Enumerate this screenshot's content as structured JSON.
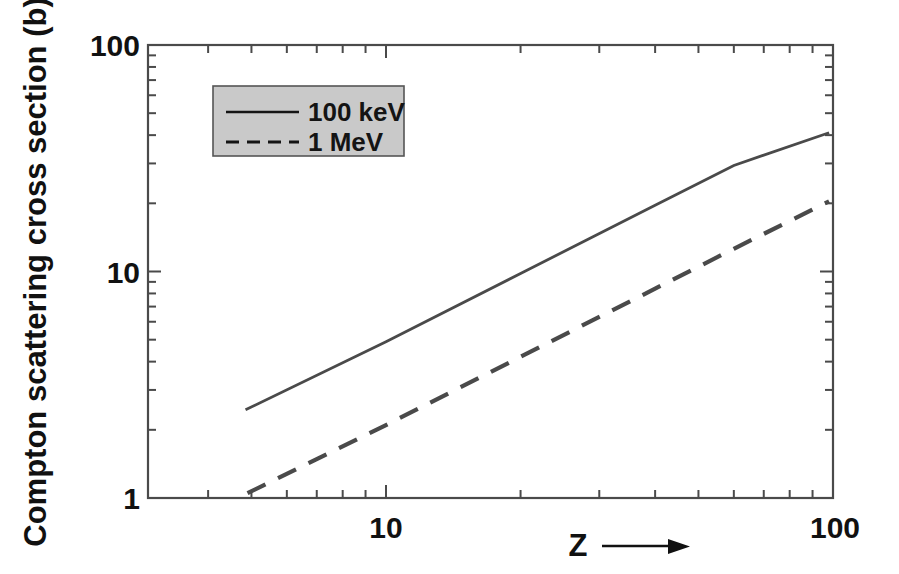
{
  "chart_data": {
    "type": "line",
    "title": "",
    "subtitle": "",
    "xlabel": "Z",
    "xlabel_suffix_icon": "right-arrow",
    "ylabel": "Compton scattering cross section (b)",
    "xscale": "log",
    "yscale": "log",
    "xlim": [
      4.0,
      100
    ],
    "ylim": [
      1,
      100
    ],
    "xticks": [
      10,
      100
    ],
    "xtick_labels": [
      "10",
      "100"
    ],
    "yticks": [
      1,
      10,
      100
    ],
    "ytick_labels": [
      "1",
      "10",
      "100"
    ],
    "grid": false,
    "legend_position": "upper-left-inside",
    "legend_facecolor": "#c9c9c9",
    "legend_edgecolor": "#555555",
    "axis_color": "#4a4a4a",
    "series": [
      {
        "name": "100 keV",
        "style": "solid",
        "color": "#4a4a4a",
        "x": [
          4.85,
          10,
          20,
          40,
          60,
          98
        ],
        "y": [
          2.45,
          4.9,
          9.8,
          19.6,
          29.4,
          41.0
        ]
      },
      {
        "name": "1 MeV",
        "style": "dashed",
        "color": "#4a4a4a",
        "x": [
          4.9,
          10,
          20,
          40,
          60,
          98
        ],
        "y": [
          1.05,
          2.1,
          4.2,
          8.4,
          12.6,
          20.4
        ]
      }
    ],
    "legend_entries": [
      {
        "label": "100 keV",
        "style": "solid"
      },
      {
        "label": "1 MeV",
        "style": "dashed"
      }
    ]
  },
  "figure": {
    "ylabel": "Compton scattering cross section (b)",
    "xlabel": "Z",
    "ytick_100": "100",
    "ytick_10": "10",
    "ytick_1": "1",
    "xtick_10": "10",
    "xtick_100": "100",
    "legend_label_1": "100 keV",
    "legend_label_2": "1 MeV"
  }
}
